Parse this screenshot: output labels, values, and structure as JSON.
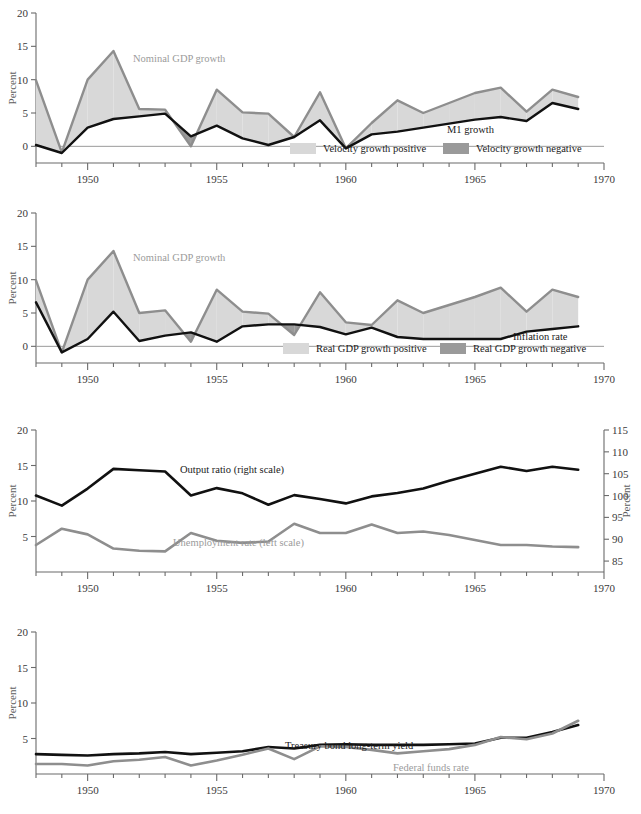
{
  "figure": {
    "panel_count": 4,
    "colors": {
      "line_dark": "#111111",
      "line_gray": "#8e8e8e",
      "band_positive": "#d8d8d8",
      "band_negative": "#9a9a9a",
      "axis": "#6b6b6b",
      "label_gray": "#9b9b9b"
    }
  },
  "chart_data": [
    {
      "id": "velocity",
      "type": "area",
      "title": "",
      "xlabel": "",
      "ylabel": "Percent",
      "xlim": [
        1948,
        1970
      ],
      "ylim": [
        -2.5,
        20
      ],
      "ytick_values": [
        0,
        5,
        10,
        15,
        20
      ],
      "ytick_labels": [
        "0",
        "5",
        "10",
        "15",
        "20"
      ],
      "xtick_values": [
        1950,
        1955,
        1960,
        1965,
        1970
      ],
      "xtick_labels": [
        "1950",
        "1955",
        "1960",
        "1965",
        "1970"
      ],
      "grid": false,
      "x": [
        1948,
        1949,
        1950,
        1951,
        1952,
        1953,
        1954,
        1955,
        1956,
        1957,
        1958,
        1959,
        1960,
        1961,
        1962,
        1963,
        1964,
        1965,
        1966,
        1967,
        1968,
        1969
      ],
      "series": [
        {
          "name": "Nominal GDP growth",
          "label": "Nominal GDP growth",
          "color": "#8e8e8e",
          "values": [
            9.9,
            -0.9,
            10.0,
            14.3,
            5.6,
            5.5,
            0.0,
            8.5,
            5.1,
            4.9,
            1.4,
            8.1,
            -0.3,
            3.5,
            6.9,
            5.0,
            6.5,
            8.0,
            8.8,
            5.2,
            8.5,
            7.4
          ]
        },
        {
          "name": "M1 growth",
          "label": "M1 growth",
          "color": "#111111",
          "values": [
            0.2,
            -1.0,
            2.8,
            4.1,
            4.5,
            4.9,
            1.5,
            3.1,
            1.2,
            0.2,
            1.4,
            3.9,
            -0.3,
            1.8,
            2.2,
            2.8,
            3.4,
            4.0,
            4.4,
            3.8,
            6.5,
            5.6
          ]
        }
      ],
      "legend_position": "inside-bottom-right",
      "legend": [
        {
          "label": "Velocity growth positive",
          "color": "#d8d8d8"
        },
        {
          "label": "Velocity growth negative",
          "color": "#9a9a9a"
        }
      ]
    },
    {
      "id": "inflation",
      "type": "area",
      "title": "",
      "xlabel": "",
      "ylabel": "Percent",
      "xlim": [
        1948,
        1970
      ],
      "ylim": [
        -2.5,
        20
      ],
      "ytick_values": [
        0,
        5,
        10,
        15,
        20
      ],
      "ytick_labels": [
        "0",
        "5",
        "10",
        "15",
        "20"
      ],
      "xtick_values": [
        1950,
        1955,
        1960,
        1965,
        1970
      ],
      "xtick_labels": [
        "1950",
        "1955",
        "1960",
        "1965",
        "1970"
      ],
      "grid": false,
      "x": [
        1948,
        1949,
        1950,
        1951,
        1952,
        1953,
        1954,
        1955,
        1956,
        1957,
        1958,
        1959,
        1960,
        1961,
        1962,
        1963,
        1964,
        1965,
        1966,
        1967,
        1968,
        1969
      ],
      "series": [
        {
          "name": "Nominal GDP growth",
          "label": "Nominal GDP growth",
          "color": "#8e8e8e",
          "values": [
            9.9,
            -0.9,
            10.0,
            14.3,
            5.0,
            5.4,
            0.7,
            8.5,
            5.2,
            4.9,
            1.7,
            8.1,
            3.6,
            3.2,
            6.9,
            5.0,
            6.2,
            7.4,
            8.8,
            5.2,
            8.5,
            7.4
          ]
        },
        {
          "name": "Inflation rate",
          "label": "Inflation rate",
          "color": "#111111",
          "values": [
            6.6,
            -0.9,
            1.1,
            5.2,
            0.8,
            1.6,
            2.1,
            0.7,
            3.0,
            3.3,
            3.3,
            2.9,
            1.8,
            2.8,
            1.4,
            1.1,
            1.1,
            1.1,
            1.1,
            2.2,
            2.6,
            3.0,
            4.4,
            4.3
          ]
        }
      ],
      "legend_position": "inside-bottom-right",
      "legend": [
        {
          "label": "Real GDP growth positive",
          "color": "#d8d8d8"
        },
        {
          "label": "Real GDP growth negative",
          "color": "#9a9a9a"
        }
      ]
    },
    {
      "id": "output",
      "type": "line",
      "title": "",
      "xlabel": "",
      "ylabel": "Percent",
      "ylabel_right": "Percent",
      "xlim": [
        1948,
        1970
      ],
      "ylim": [
        0,
        20
      ],
      "ylim_right": [
        82.5,
        115
      ],
      "ytick_values": [
        5,
        10,
        15,
        20
      ],
      "ytick_labels": [
        "5",
        "10",
        "15",
        "20"
      ],
      "ytick_right_values": [
        85,
        90,
        95,
        100,
        105,
        110,
        115
      ],
      "ytick_right_labels": [
        "85",
        "90",
        "95",
        "100",
        "105",
        "110",
        "115"
      ],
      "xtick_values": [
        1950,
        1955,
        1960,
        1965,
        1970
      ],
      "xtick_labels": [
        "1950",
        "1955",
        "1960",
        "1965",
        "1970"
      ],
      "grid": false,
      "x": [
        1948,
        1949,
        1950,
        1951,
        1952,
        1953,
        1954,
        1955,
        1956,
        1957,
        1958,
        1959,
        1960,
        1961,
        1962,
        1963,
        1964,
        1965,
        1966,
        1967,
        1968,
        1969
      ],
      "series": [
        {
          "name": "Output ratio (right scale)",
          "label": "Output ratio (right scale)",
          "color": "#111111",
          "axis": "right",
          "values": [
            100.0,
            97.7,
            101.6,
            106.1,
            105.8,
            105.5,
            100.0,
            101.7,
            100.5,
            97.9,
            100.1,
            99.2,
            98.2,
            99.8,
            100.6,
            101.6,
            103.4,
            105.0,
            106.6,
            105.6,
            106.6,
            105.9
          ]
        },
        {
          "name": "Unemployment rate (left scale)",
          "label": "Unemployment rate (left scale)",
          "color": "#8e8e8e",
          "axis": "left",
          "values": [
            3.8,
            6.1,
            5.3,
            3.3,
            3.0,
            2.9,
            5.5,
            4.4,
            4.1,
            4.3,
            6.8,
            5.5,
            5.5,
            6.7,
            5.5,
            5.7,
            5.2,
            4.5,
            3.8,
            3.8,
            3.6,
            3.5
          ]
        }
      ],
      "legend_position": "inline-labels"
    },
    {
      "id": "rates",
      "type": "line",
      "title": "",
      "xlabel": "",
      "ylabel": "Percent",
      "xlim": [
        1948,
        1970
      ],
      "ylim": [
        0,
        20
      ],
      "ytick_values": [
        5,
        10,
        15,
        20
      ],
      "ytick_labels": [
        "5",
        "10",
        "15",
        "20"
      ],
      "xtick_values": [
        1950,
        1955,
        1960,
        1965,
        1970
      ],
      "xtick_labels": [
        "1950",
        "1955",
        "1960",
        "1965",
        "1970"
      ],
      "grid": false,
      "x": [
        1948,
        1949,
        1950,
        1951,
        1952,
        1953,
        1954,
        1955,
        1956,
        1957,
        1958,
        1959,
        1960,
        1961,
        1962,
        1963,
        1964,
        1965,
        1966,
        1967,
        1968,
        1969
      ],
      "series": [
        {
          "name": "Treasury bond long-term yield",
          "label": "Treasury bond long-term yield",
          "color": "#111111",
          "values": [
            2.8,
            2.7,
            2.6,
            2.8,
            2.9,
            3.1,
            2.8,
            3.0,
            3.2,
            3.8,
            3.6,
            4.1,
            4.2,
            4.1,
            4.1,
            4.1,
            4.2,
            4.3,
            5.1,
            5.1,
            5.9,
            6.9
          ]
        },
        {
          "name": "Federal funds rate",
          "label": "Federal funds rate",
          "color": "#8e8e8e",
          "values": [
            1.4,
            1.4,
            1.2,
            1.8,
            2.0,
            2.4,
            1.2,
            1.9,
            2.7,
            3.6,
            2.1,
            3.9,
            3.8,
            3.4,
            2.9,
            3.2,
            3.5,
            4.1,
            5.2,
            4.9,
            5.7,
            7.5
          ]
        }
      ],
      "legend_position": "inline-labels"
    }
  ]
}
